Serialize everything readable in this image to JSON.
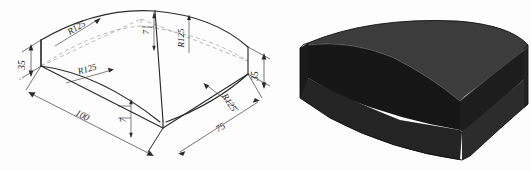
{
  "figure": {
    "background_color": "#fdfdfd",
    "line_color": "#2b2b2b",
    "hidden_line_color": "#9a9a9a",
    "text_color": "#1b1b1b"
  },
  "drawing": {
    "name": "isometric-dimensioned-view",
    "dimensions": [
      {
        "id": "height-left",
        "label": "35",
        "orientation": "vertical",
        "location": "left-end-face"
      },
      {
        "id": "height-right",
        "label": "35",
        "orientation": "vertical",
        "location": "right-end-face"
      },
      {
        "id": "length-front-left",
        "label": "100",
        "orientation": "isometric-left",
        "location": "front-left-bottom-edge"
      },
      {
        "id": "length-front-right",
        "label": "75",
        "orientation": "isometric-right",
        "location": "front-right-bottom-edge"
      },
      {
        "id": "depth-top",
        "label": "7",
        "orientation": "vertical",
        "location": "top-rear-center"
      },
      {
        "id": "depth-front",
        "label": "7",
        "orientation": "vertical",
        "location": "front-valley-center"
      }
    ],
    "radii": [
      {
        "id": "radius-top-left-arc",
        "label": "R125",
        "location": "top-surface-left-arc"
      },
      {
        "id": "radius-top-right-arc",
        "label": "R125",
        "location": "top-surface-right-arc"
      },
      {
        "id": "radius-valley-left",
        "label": "R125",
        "location": "valley-left-curve"
      },
      {
        "id": "radius-valley-right",
        "label": "R125",
        "location": "valley-right-curve"
      }
    ]
  },
  "solid": {
    "name": "shaded-solid-view",
    "colors": {
      "top_face": "#3c3c3c",
      "valley_face_left": "#161616",
      "valley_face_right": "#1d1d1d",
      "front_left_face": "#242424",
      "front_right_face": "#2c2c2c",
      "end_face": "#1a1a1a",
      "outline": "#0d0d0d"
    }
  }
}
